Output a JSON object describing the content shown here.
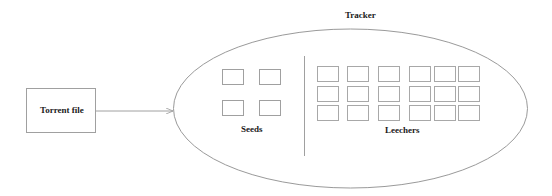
{
  "diagram": {
    "torrent_file": {
      "label": "Torrent file"
    },
    "tracker": {
      "label": "Tracker"
    },
    "seeds": {
      "label": "Seeds",
      "count": 4,
      "rows": 2,
      "cols": 2
    },
    "leechers": {
      "label": "Leechers",
      "count": 18,
      "rows": 3,
      "cols": 6
    },
    "arrow": {
      "from": "Torrent file",
      "to": "Tracker"
    },
    "colors": {
      "stroke": "#9a9a9a",
      "text": "#1a1a1a",
      "background": "#ffffff"
    }
  }
}
